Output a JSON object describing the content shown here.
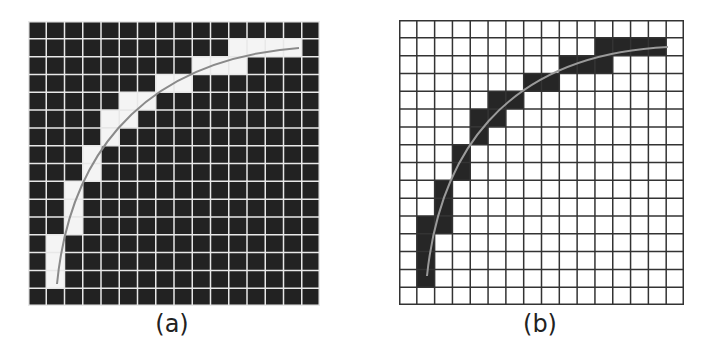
{
  "figure": {
    "panels": [
      {
        "id": "a",
        "caption": "(a)",
        "grid_size": 16,
        "background_color": "#222222",
        "highlight_color": "#f4f4f4",
        "grid_line_color": "#e8e8e8",
        "curve_color": "#8a8a8a",
        "description": "Dark grid with white cells tracing the curve path",
        "highlighted_cells": [
          [
            1,
            11
          ],
          [
            1,
            12
          ],
          [
            1,
            13
          ],
          [
            1,
            14
          ],
          [
            2,
            9
          ],
          [
            2,
            10
          ],
          [
            2,
            11
          ],
          [
            3,
            7
          ],
          [
            3,
            8
          ],
          [
            4,
            5
          ],
          [
            4,
            6
          ],
          [
            5,
            4
          ],
          [
            5,
            5
          ],
          [
            6,
            4
          ],
          [
            7,
            3
          ],
          [
            8,
            3
          ],
          [
            9,
            2
          ],
          [
            10,
            2
          ],
          [
            11,
            2
          ],
          [
            12,
            1
          ],
          [
            13,
            1
          ],
          [
            14,
            1
          ]
        ]
      },
      {
        "id": "b",
        "caption": "(b)",
        "grid_size": 16,
        "background_color": "#ffffff",
        "highlight_color": "#262626",
        "grid_line_color": "#333333",
        "curve_color": "#9a9a9a",
        "description": "White grid with dark cells tracing the curve path",
        "highlighted_cells": [
          [
            1,
            11
          ],
          [
            1,
            12
          ],
          [
            1,
            13
          ],
          [
            1,
            14
          ],
          [
            2,
            9
          ],
          [
            2,
            10
          ],
          [
            2,
            11
          ],
          [
            3,
            7
          ],
          [
            3,
            8
          ],
          [
            4,
            5
          ],
          [
            4,
            6
          ],
          [
            5,
            4
          ],
          [
            5,
            5
          ],
          [
            6,
            4
          ],
          [
            7,
            3
          ],
          [
            8,
            3
          ],
          [
            9,
            2
          ],
          [
            10,
            2
          ],
          [
            11,
            1
          ],
          [
            11,
            2
          ],
          [
            12,
            1
          ],
          [
            13,
            1
          ],
          [
            14,
            1
          ]
        ]
      }
    ]
  }
}
